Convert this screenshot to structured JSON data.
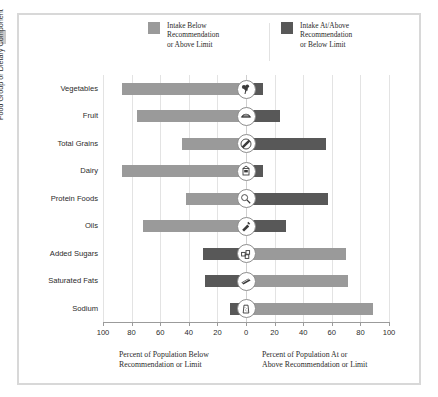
{
  "legend": {
    "items": [
      {
        "label_line1": "Intake Below",
        "label_line2": "Recommendation",
        "label_line3": "or Above Limit",
        "color": "#9a9a9a",
        "name": "intake-below"
      },
      {
        "label_line1": "Intake At/Above",
        "label_line2": "Recommendation",
        "label_line3": "or Below Limit",
        "color": "#585858",
        "name": "intake-at-above"
      }
    ]
  },
  "axes": {
    "y_title": "Food Group or Dietary Component",
    "x_tick_labels": [
      "100",
      "80",
      "60",
      "40",
      "20",
      "0",
      "20",
      "40",
      "60",
      "80",
      "100"
    ],
    "x_caption_left_line1": "Percent of Population Below",
    "x_caption_left_line2": "Recommendation or Limit",
    "x_caption_right_line1": "Percent of Population At or",
    "x_caption_right_line2": "Above Recommendation or Limit"
  },
  "chart_data": {
    "type": "bar",
    "title": "",
    "subtitle": "",
    "orientation": "horizontal-diverging",
    "xlabel": "Percent of Population",
    "ylabel": "Food Group or Dietary Component",
    "xlim": [
      -100,
      100
    ],
    "x_ticks": [
      -100,
      -80,
      -60,
      -40,
      -20,
      0,
      20,
      40,
      60,
      80,
      100
    ],
    "grid": true,
    "legend_position": "top",
    "categories": [
      "Vegetables",
      "Fruit",
      "Total Grains",
      "Dairy",
      "Protein Foods",
      "Oils",
      "Added Sugars",
      "Saturated Fats",
      "Sodium"
    ],
    "series": [
      {
        "name": "Intake Below Recommendation or Above Limit",
        "color": "#9a9a9a",
        "values": [
          87,
          76,
          45,
          87,
          42,
          72,
          70,
          71,
          89
        ]
      },
      {
        "name": "Intake At/Above Recommendation or Below Limit",
        "color": "#585858",
        "values": [
          12,
          24,
          56,
          12,
          57,
          28,
          30,
          29,
          11
        ]
      }
    ],
    "rows": [
      {
        "category": "Vegetables",
        "below": 87,
        "at_or_above": 12,
        "below_side": "left",
        "below_color": "#9a9a9a",
        "above_color": "#585858",
        "icon": "broccoli-icon"
      },
      {
        "category": "Fruit",
        "below": 76,
        "at_or_above": 24,
        "below_side": "left",
        "below_color": "#9a9a9a",
        "above_color": "#585858",
        "icon": "fruit-icon"
      },
      {
        "category": "Total Grains",
        "below": 45,
        "at_or_above": 56,
        "below_side": "left",
        "below_color": "#9a9a9a",
        "above_color": "#585858",
        "icon": "grains-icon"
      },
      {
        "category": "Dairy",
        "below": 87,
        "at_or_above": 12,
        "below_side": "left",
        "below_color": "#9a9a9a",
        "above_color": "#585858",
        "icon": "dairy-icon"
      },
      {
        "category": "Protein Foods",
        "below": 42,
        "at_or_above": 57,
        "below_side": "left",
        "below_color": "#9a9a9a",
        "above_color": "#585858",
        "icon": "protein-icon"
      },
      {
        "category": "Oils",
        "below": 72,
        "at_or_above": 28,
        "below_side": "left",
        "below_color": "#9a9a9a",
        "above_color": "#585858",
        "icon": "oils-icon"
      },
      {
        "category": "Added Sugars",
        "below": 30,
        "at_or_above": 70,
        "below_side": "left",
        "below_color": "#585858",
        "above_color": "#9a9a9a",
        "icon": "added-sugars-icon"
      },
      {
        "category": "Saturated Fats",
        "below": 29,
        "at_or_above": 71,
        "below_side": "left",
        "below_color": "#585858",
        "above_color": "#9a9a9a",
        "icon": "saturated-fats-icon"
      },
      {
        "category": "Sodium",
        "below": 11,
        "at_or_above": 89,
        "below_side": "left",
        "below_color": "#585858",
        "above_color": "#9a9a9a",
        "icon": "sodium-icon"
      }
    ]
  },
  "colors": {
    "light_gray": "#9a9a9a",
    "dark_gray": "#585858",
    "grid": "#e3e3e3",
    "axis": "#9b9b9b",
    "text": "#2b2b2b",
    "frame": "#d8d8d8"
  }
}
